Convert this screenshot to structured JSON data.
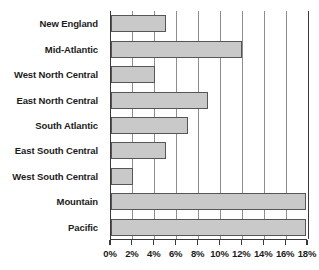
{
  "chart_data": {
    "type": "bar",
    "orientation": "horizontal",
    "title": "",
    "subtitle": "",
    "xlabel": "",
    "ylabel": "",
    "categories": [
      "New England",
      "Mid-Atlantic",
      "West North Central",
      "East North Central",
      "South Atlantic",
      "East South Central",
      "West South Central",
      "Mountain",
      "Pacific"
    ],
    "values": [
      5.0,
      12.0,
      4.0,
      8.9,
      7.0,
      5.0,
      2.0,
      17.8,
      17.8
    ],
    "value_unit": "%",
    "xlim": [
      0,
      18
    ],
    "xticks": [
      0,
      2,
      4,
      6,
      8,
      10,
      12,
      14,
      16,
      18
    ],
    "xtick_labels": [
      "0%",
      "2%",
      "4%",
      "6%",
      "8%",
      "10%",
      "12%",
      "14%",
      "16%",
      "18%"
    ],
    "grid": true,
    "grid_axis": "x",
    "legend": false,
    "legend_position": "none",
    "bar_fill_color": "#c9c9c9",
    "bar_border_color": "#565656",
    "axis_color": "#3a3a3a",
    "gridline_color": "#8d8d8d"
  }
}
